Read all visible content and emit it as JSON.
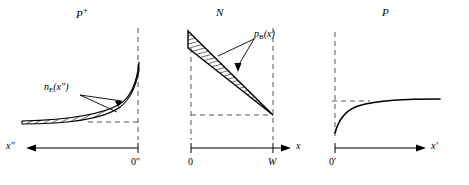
{
  "figure": {
    "type": "diagram",
    "panels": [
      {
        "id": "p-plus",
        "title": "P",
        "title_superscript": "+",
        "axis_label": "x″",
        "axis_direction": "left",
        "origin_label": "0″",
        "curve_label": "n",
        "curve_label_sub": "E",
        "curve_label_arg": "(x″)",
        "curve_style": "hatched-band",
        "curve_shape": "exponential rise toward origin at right"
      },
      {
        "id": "n",
        "title": "N",
        "axis_label": "x",
        "axis_direction": "right",
        "origin_label": "0",
        "end_label": "W",
        "curve_label": "p",
        "curve_label_sub": "B",
        "curve_label_arg": "(x)",
        "curve_style": "hatched-wedge",
        "curve_shape": "linear decay from 0 to W converging at W"
      },
      {
        "id": "p",
        "title": "P",
        "axis_label": "x′",
        "axis_direction": "right",
        "origin_label": "0′",
        "curve_style": "solid",
        "curve_shape": "saturating rise to horizontal asymptote"
      }
    ],
    "colors": {
      "ink": "#000000",
      "dashed": "#555555",
      "background": "#ffffff"
    }
  }
}
